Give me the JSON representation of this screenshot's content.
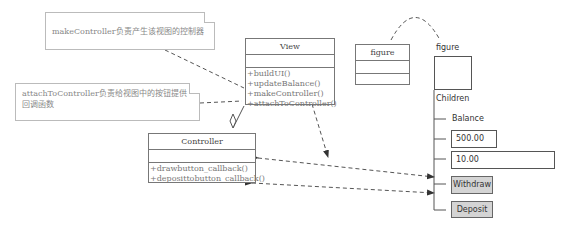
{
  "notes": [
    {
      "text": "makeController负责产生该视图的控制器"
    },
    {
      "text": "attachToController负责给视图中的按钮提供回调函数"
    }
  ],
  "view_class": {
    "name": "View",
    "operations": [
      "+buildUI()",
      "+updateBalance()",
      "+makeController()",
      "+attachToController()"
    ]
  },
  "controller_class": {
    "name": "Controller",
    "operations": [
      "+drawbutton_callback()",
      "+deposittobutton_callback()"
    ]
  },
  "figure_class": {
    "name": "figure"
  },
  "figure_tree": {
    "root_label": "figure",
    "children_label": "Children",
    "items": [
      {
        "label": "Balance",
        "type": "text"
      },
      {
        "label": "500.00",
        "type": "field"
      },
      {
        "label": "10.00",
        "type": "field"
      },
      {
        "label": "Withdraw",
        "type": "button"
      },
      {
        "label": "Deposit",
        "type": "button"
      }
    ]
  }
}
